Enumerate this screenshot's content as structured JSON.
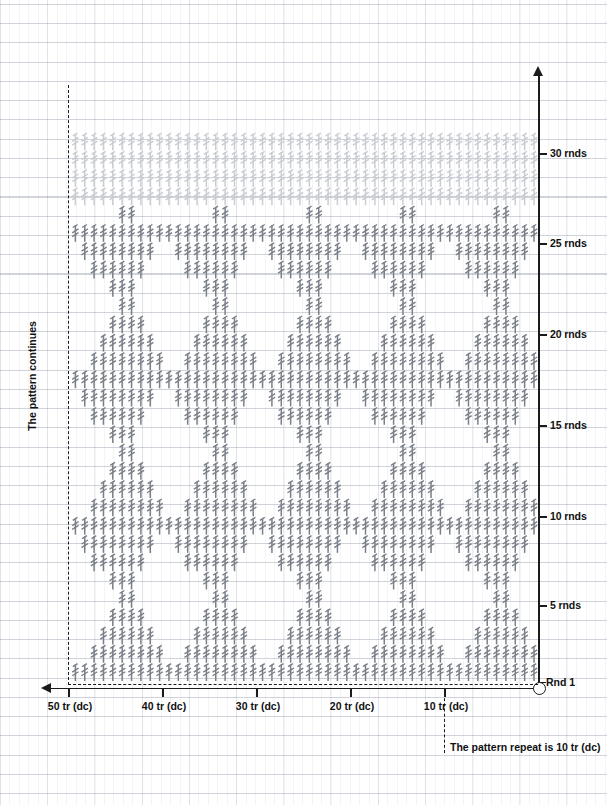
{
  "chart_data": {
    "type": "table",
    "xlabel": "stitches",
    "ylabel": "rounds",
    "grid": true,
    "legend": "none",
    "xlim": [
      0,
      52
    ],
    "ylim": [
      0,
      31
    ],
    "x_ticks": [
      {
        "value": 10,
        "label": "10 tr (dc)",
        "px": 444
      },
      {
        "value": 20,
        "label": "20 tr (dc)",
        "px": 350
      },
      {
        "value": 30,
        "label": "30 tr (dc)",
        "px": 256
      },
      {
        "value": 40,
        "label": "40 tr (dc)",
        "px": 162
      },
      {
        "value": 50,
        "label": "50 tr (dc)",
        "px": 68
      }
    ],
    "y_ticks": [
      {
        "value": 1,
        "label": "Rnd 1",
        "px": 682
      },
      {
        "value": 5,
        "label": "5 rnds",
        "px": 605
      },
      {
        "value": 10,
        "label": "10 rnds",
        "px": 516
      },
      {
        "value": 15,
        "label": "15 rnds",
        "px": 425
      },
      {
        "value": 20,
        "label": "20 rnds",
        "px": 334
      },
      {
        "value": 25,
        "label": "25 rnds",
        "px": 243
      },
      {
        "value": 30,
        "label": "30 rnds",
        "px": 153
      }
    ],
    "stitch_symbol": "treble-crochet",
    "stitch_symbol_description": "vertical stroke with slanted top and two diagonal crossbars",
    "stitch_color": "#7a7f88",
    "faded_stitch_color": "#c9ccd2",
    "axis_color": "#1b1b1b",
    "repeat_width": 10,
    "motif_period_rounds": 7,
    "columns": 50,
    "rounds": 30,
    "rows": [
      {
        "rnd": 1,
        "faded": false,
        "offsets": [
          0,
          1,
          2,
          3,
          4,
          5,
          6,
          7,
          8,
          9
        ]
      },
      {
        "rnd": 2,
        "faded": false,
        "offsets": [
          0,
          1,
          2,
          3,
          4,
          5,
          6,
          7
        ]
      },
      {
        "rnd": 3,
        "faded": false,
        "offsets": [
          1,
          2,
          3,
          4,
          5,
          6
        ]
      },
      {
        "rnd": 4,
        "faded": false,
        "offsets": [
          2,
          3,
          4,
          5
        ]
      },
      {
        "rnd": 5,
        "faded": false,
        "offsets": [
          3,
          4
        ]
      },
      {
        "rnd": 6,
        "faded": false,
        "offsets": [
          3,
          4,
          5
        ]
      },
      {
        "rnd": 7,
        "faded": false,
        "offsets": [
          2,
          3,
          4,
          5,
          6,
          7
        ]
      },
      {
        "rnd": 8,
        "faded": false,
        "offsets": [
          1,
          2,
          3,
          4,
          5,
          6,
          7,
          8
        ]
      },
      {
        "rnd": 9,
        "faded": false,
        "offsets": [
          0,
          1,
          2,
          3,
          4,
          5,
          6,
          7,
          8,
          9
        ]
      },
      {
        "rnd": 10,
        "faded": false,
        "offsets": [
          0,
          1,
          2,
          3,
          4,
          5,
          6,
          7
        ]
      },
      {
        "rnd": 11,
        "faded": false,
        "offsets": [
          1,
          2,
          3,
          4,
          5,
          6
        ]
      },
      {
        "rnd": 12,
        "faded": false,
        "offsets": [
          2,
          3,
          4,
          5
        ]
      },
      {
        "rnd": 13,
        "faded": false,
        "offsets": [
          3,
          4
        ]
      },
      {
        "rnd": 14,
        "faded": false,
        "offsets": [
          3,
          4,
          5
        ]
      },
      {
        "rnd": 15,
        "faded": false,
        "offsets": [
          2,
          3,
          4,
          5,
          6,
          7
        ]
      },
      {
        "rnd": 16,
        "faded": false,
        "offsets": [
          1,
          2,
          3,
          4,
          5,
          6,
          7,
          8
        ]
      },
      {
        "rnd": 17,
        "faded": false,
        "offsets": [
          0,
          1,
          2,
          3,
          4,
          5,
          6,
          7,
          8,
          9
        ]
      },
      {
        "rnd": 18,
        "faded": false,
        "offsets": [
          0,
          1,
          2,
          3,
          4,
          5,
          6,
          7
        ]
      },
      {
        "rnd": 19,
        "faded": false,
        "offsets": [
          1,
          2,
          3,
          4,
          5,
          6
        ]
      },
      {
        "rnd": 20,
        "faded": false,
        "offsets": [
          2,
          3,
          4,
          5
        ]
      },
      {
        "rnd": 21,
        "faded": false,
        "offsets": [
          3,
          4
        ]
      },
      {
        "rnd": 22,
        "faded": false,
        "offsets": [
          3,
          4,
          5
        ]
      },
      {
        "rnd": 23,
        "faded": false,
        "offsets": [
          2,
          3,
          4,
          5,
          6,
          7
        ]
      },
      {
        "rnd": 24,
        "faded": false,
        "offsets": [
          1,
          2,
          3,
          4,
          5,
          6,
          7,
          8
        ]
      },
      {
        "rnd": 25,
        "faded": false,
        "offsets": [
          0,
          1,
          2,
          3,
          4,
          5,
          6,
          7,
          8,
          9
        ]
      },
      {
        "rnd": 26,
        "faded": false,
        "offsets": [
          3,
          4
        ]
      },
      {
        "rnd": 27,
        "faded": true,
        "offsets": [
          0,
          1,
          2,
          3,
          4,
          5,
          6,
          7,
          8,
          9
        ]
      },
      {
        "rnd": 28,
        "faded": true,
        "offsets": [
          0,
          1,
          2,
          3,
          4,
          5,
          6,
          7,
          8,
          9
        ]
      },
      {
        "rnd": 29,
        "faded": true,
        "offsets": [
          0,
          1,
          2,
          3,
          4,
          5,
          6,
          7,
          8,
          9
        ]
      },
      {
        "rnd": 30,
        "faded": true,
        "offsets": [
          0,
          1,
          2,
          3,
          4,
          5,
          6,
          7,
          8,
          9
        ]
      }
    ]
  },
  "labels": {
    "pattern_continues": "The pattern continues",
    "pattern_repeat": "The pattern repeat is 10 tr (dc)",
    "round_one": "Rnd 1"
  },
  "geometry": {
    "x_right_px": 534,
    "x_step_px": 9.36,
    "y_base_px": 681,
    "y_step_px": 18.3,
    "left_dash_px": 68
  }
}
